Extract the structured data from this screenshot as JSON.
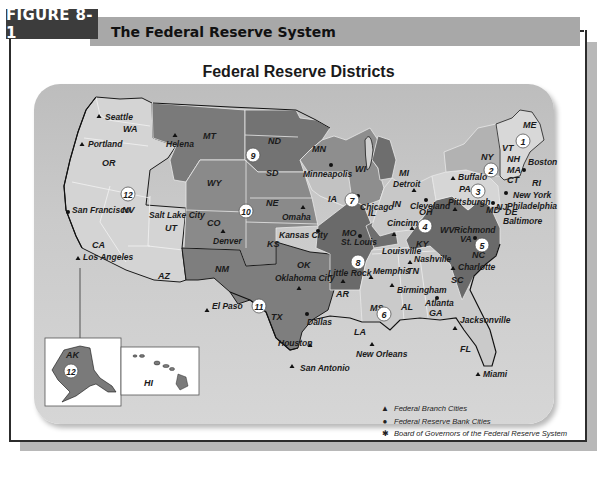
{
  "figure": {
    "number_label": "FIGURE 8-1",
    "title": "The Federal Reserve System"
  },
  "map": {
    "title": "Federal Reserve Districts",
    "colors": {
      "background": "#c8c8c8",
      "district_light": "#d2d2d2",
      "district_mid": "#a9a9a9",
      "district_dark": "#7a7a7a",
      "district_darker": "#666666",
      "border": "#1a1a1a"
    },
    "districts": [
      {
        "number": "1",
        "reserve_bank_city": "Boston",
        "states": [
          "ME",
          "NH",
          "VT",
          "MA",
          "CT",
          "RI"
        ]
      },
      {
        "number": "2",
        "reserve_bank_city": "New York",
        "states": [
          "NY"
        ]
      },
      {
        "number": "3",
        "reserve_bank_city": "Philadelphia",
        "states": [
          "PA",
          "NJ",
          "DE"
        ]
      },
      {
        "number": "4",
        "reserve_bank_city": "Cleveland",
        "states": [
          "OH",
          "KY"
        ]
      },
      {
        "number": "5",
        "reserve_bank_city": "Richmond",
        "states": [
          "VA",
          "WV",
          "MD",
          "NC",
          "SC"
        ]
      },
      {
        "number": "6",
        "reserve_bank_city": "Atlanta",
        "states": [
          "GA",
          "AL",
          "FL",
          "TN",
          "MS",
          "LA"
        ]
      },
      {
        "number": "7",
        "reserve_bank_city": "Chicago",
        "states": [
          "IA",
          "IL",
          "IN",
          "MI",
          "WI"
        ]
      },
      {
        "number": "8",
        "reserve_bank_city": "St. Louis",
        "states": [
          "MO",
          "AR"
        ]
      },
      {
        "number": "9",
        "reserve_bank_city": "Minneapolis",
        "states": [
          "MN",
          "ND",
          "SD",
          "MT"
        ]
      },
      {
        "number": "10",
        "reserve_bank_city": "Kansas City",
        "states": [
          "WY",
          "CO",
          "NE",
          "KS",
          "OK",
          "NM"
        ]
      },
      {
        "number": "11",
        "reserve_bank_city": "Dallas",
        "states": [
          "TX"
        ]
      },
      {
        "number": "12",
        "reserve_bank_city": "San Francisco",
        "states": [
          "WA",
          "OR",
          "CA",
          "NV",
          "ID",
          "UT",
          "AZ",
          "AK",
          "HI"
        ]
      }
    ],
    "state_labels": [
      "WA",
      "OR",
      "CA",
      "NV",
      "UT",
      "AZ",
      "MT",
      "WY",
      "CO",
      "NM",
      "ND",
      "SD",
      "NE",
      "KS",
      "OK",
      "TX",
      "MN",
      "IA",
      "MO",
      "AR",
      "LA",
      "WI",
      "IL",
      "MI",
      "IN",
      "OH",
      "KY",
      "TN",
      "MS",
      "AL",
      "GA",
      "FL",
      "SC",
      "NC",
      "VA",
      "WV",
      "PA",
      "NY",
      "VT",
      "NH",
      "ME",
      "MA",
      "CT",
      "RI",
      "NJ",
      "DE",
      "MD",
      "AK",
      "HI"
    ],
    "branch_cities": [
      "Seattle",
      "Portland",
      "Helena",
      "Salt Lake City",
      "Los Angeles",
      "Denver",
      "Omaha",
      "Oklahoma City",
      "El Paso",
      "Houston",
      "San Antonio",
      "Little Rock",
      "Memphis",
      "Louisville",
      "Nashville",
      "Birmingham",
      "Jacksonville",
      "Miami",
      "New Orleans",
      "Cincinnati",
      "Pittsburgh",
      "Buffalo",
      "Detroit",
      "Baltimore",
      "Charlotte"
    ],
    "reserve_bank_cities": [
      "Boston",
      "New York",
      "Philadelphia",
      "Cleveland",
      "Richmond",
      "Atlanta",
      "Chicago",
      "St. Louis",
      "Minneapolis",
      "Kansas City",
      "Dallas",
      "San Francisco"
    ]
  },
  "legend": {
    "items": [
      {
        "symbol": "▲",
        "label": "Federal Branch Cities"
      },
      {
        "symbol": "●",
        "label": "Federal Reserve Bank Cities"
      },
      {
        "symbol": "✱",
        "label": "Board of Governors of the Federal Reserve System"
      }
    ]
  }
}
